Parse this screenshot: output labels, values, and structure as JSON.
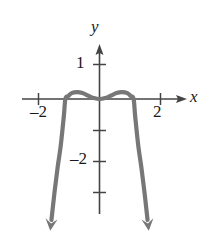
{
  "chart_data": {
    "type": "line",
    "title": "",
    "xlabel": "x",
    "ylabel": "y",
    "xlim": [
      -2.6,
      2.8
    ],
    "ylim": [
      -3.6,
      1.5
    ],
    "grid": false,
    "legend": null,
    "axis_arrows": [
      "x-positive",
      "y-positive"
    ],
    "x_ticks": [
      -2,
      2
    ],
    "x_tick_labels": [
      "–2",
      "2"
    ],
    "y_ticks": [
      1,
      -1,
      -2,
      -3
    ],
    "y_tick_labels": [
      "1",
      "",
      "–2",
      ""
    ],
    "curve_color": "#777777",
    "axis_color": "#444444",
    "x_intercepts": [
      -1.1,
      0,
      1.1
    ],
    "local_maxima": [
      {
        "x": -0.72,
        "y": 0.22
      },
      {
        "x": 0.72,
        "y": 0.22
      }
    ],
    "local_minima": [
      {
        "x": 0,
        "y": 0
      }
    ],
    "series": [
      {
        "name": "f",
        "points": [
          {
            "x": -1.55,
            "y": -3.9
          },
          {
            "x": -1.45,
            "y": -3.0
          },
          {
            "x": -1.35,
            "y": -2.2
          },
          {
            "x": -1.25,
            "y": -1.5
          },
          {
            "x": -1.15,
            "y": -0.55
          },
          {
            "x": -1.1,
            "y": 0.0
          },
          {
            "x": -1.0,
            "y": 0.1
          },
          {
            "x": -0.9,
            "y": 0.19
          },
          {
            "x": -0.72,
            "y": 0.22
          },
          {
            "x": -0.55,
            "y": 0.19
          },
          {
            "x": -0.35,
            "y": 0.1
          },
          {
            "x": -0.18,
            "y": 0.03
          },
          {
            "x": 0.0,
            "y": 0.0
          },
          {
            "x": 0.18,
            "y": 0.03
          },
          {
            "x": 0.35,
            "y": 0.1
          },
          {
            "x": 0.55,
            "y": 0.19
          },
          {
            "x": 0.72,
            "y": 0.22
          },
          {
            "x": 0.9,
            "y": 0.19
          },
          {
            "x": 1.0,
            "y": 0.1
          },
          {
            "x": 1.1,
            "y": 0.0
          },
          {
            "x": 1.15,
            "y": -0.55
          },
          {
            "x": 1.25,
            "y": -1.5
          },
          {
            "x": 1.35,
            "y": -2.2
          },
          {
            "x": 1.45,
            "y": -3.0
          },
          {
            "x": 1.55,
            "y": -3.9
          }
        ]
      }
    ]
  },
  "figure": {
    "y_axis_label": "y",
    "x_axis_label": "x",
    "x_tick_neg2": "–2",
    "x_tick_pos2": "2",
    "y_tick_pos1": "1",
    "y_tick_neg2": "–2"
  }
}
